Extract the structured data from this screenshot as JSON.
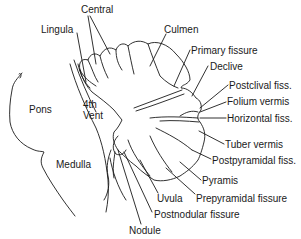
{
  "diagram": {
    "colors": {
      "ink": "#1a1a1a",
      "background": "#ffffff"
    },
    "labels": [
      {
        "id": "central",
        "text": "Central",
        "x": 81,
        "y": 4
      },
      {
        "id": "lingula",
        "text": "Lingula",
        "x": 41,
        "y": 24
      },
      {
        "id": "culmen",
        "text": "Culmen",
        "x": 164,
        "y": 24
      },
      {
        "id": "primary_fissure",
        "text": "Primary fissure",
        "x": 191,
        "y": 46
      },
      {
        "id": "declive",
        "text": "Declive",
        "x": 210,
        "y": 62
      },
      {
        "id": "postclival_fiss",
        "text": "Postclival fiss.",
        "x": 229,
        "y": 80
      },
      {
        "id": "folium_vermis",
        "text": "Folium vermis",
        "x": 227,
        "y": 97
      },
      {
        "id": "horizontal_fiss",
        "text": "Horizontal fiss.",
        "x": 227,
        "y": 113
      },
      {
        "id": "tuber_vermis",
        "text": "Tuber vermis",
        "x": 225,
        "y": 140
      },
      {
        "id": "postpyramidal_fiss",
        "text": "Postpyramidal fiss.",
        "x": 212,
        "y": 155
      },
      {
        "id": "pyramis",
        "text": "Pyramis",
        "x": 202,
        "y": 176
      },
      {
        "id": "prepyramidal_fissure",
        "text": "Prepyramidal fissure",
        "x": 196,
        "y": 194
      },
      {
        "id": "uvula",
        "text": "Uvula",
        "x": 157,
        "y": 194
      },
      {
        "id": "postnodular_fissure",
        "text": "Postnodular fissure",
        "x": 154,
        "y": 210
      },
      {
        "id": "nodule",
        "text": "Nodule",
        "x": 129,
        "y": 225
      },
      {
        "id": "pons",
        "text": "Pons",
        "x": 29,
        "y": 104
      },
      {
        "id": "fourth_vent",
        "text": "4th\nVent",
        "x": 83,
        "y": 99
      },
      {
        "id": "medulla",
        "text": "Medulla",
        "x": 56,
        "y": 160
      }
    ]
  }
}
